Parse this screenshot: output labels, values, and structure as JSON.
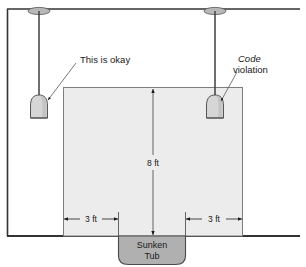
{
  "figure": {
    "colors": {
      "line": "#1a1a1a",
      "wall": "#3a3a3a",
      "zone_fill": "#ececec",
      "zone_stroke": "#6b6b6b",
      "tub_fill": "#b0b0b0",
      "tub_stroke": "#4a4a4a",
      "lamp_fill": "#d6d6d6",
      "lamp_stroke": "#555555",
      "canopy_fill": "#b8b8b8",
      "background": "#ffffff"
    }
  },
  "callouts": [
    {
      "id": "okay",
      "text": "This is okay",
      "emphasis": "",
      "style": "normal"
    },
    {
      "id": "violation",
      "text_emphasis": "Code",
      "text": "violation",
      "style": "italic-first-word"
    }
  ],
  "dimensions": {
    "height": {
      "label": "8 ft",
      "orientation": "vertical"
    },
    "left_clearance": {
      "label": "3 ft",
      "orientation": "horizontal"
    },
    "right_clearance": {
      "label": "3 ft",
      "orientation": "horizontal"
    }
  },
  "fixture": {
    "label_line1": "Sunken",
    "label_line2": "Tub",
    "name": "Sunken Tub"
  },
  "lamps": [
    {
      "id": "lamp-left",
      "position": "left",
      "status": "okay"
    },
    {
      "id": "lamp-right",
      "position": "right",
      "status": "code-violation"
    }
  ]
}
